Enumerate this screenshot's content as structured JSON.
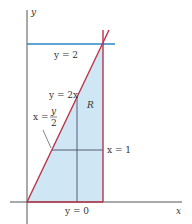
{
  "diagram": {
    "axes": {
      "x_label": "x",
      "y_label": "y"
    },
    "region_label": "R",
    "region_fill": "#cfe6f4",
    "colors": {
      "boundary": "#b8344a",
      "horizontal_line": "#2a86c8",
      "axis": "#444444",
      "inner_lines": "#3a3a5a"
    },
    "labels": {
      "top_line": "y = 2",
      "diagonal": "y = 2x",
      "diagonal_alt_lhs": "x =",
      "diagonal_alt_num": "y",
      "diagonal_alt_den": "2",
      "vertical_line": "x = 1",
      "bottom_line": "y = 0"
    }
  }
}
